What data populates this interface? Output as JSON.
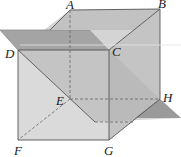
{
  "diagram": {
    "type": "geometry-figure",
    "colors": {
      "background": "#ffffff",
      "cube_face": "#d4d4d4",
      "horizontal_plane": "#a9a9a9",
      "diagonal_plane": "#b8b8b8",
      "edge": "#555555",
      "hidden_edge": "#666666"
    },
    "vertices": {
      "A": {
        "label": "A",
        "x": 70,
        "y": 10
      },
      "B": {
        "label": "B",
        "x": 160,
        "y": 9
      },
      "C": {
        "label": "C",
        "x": 109,
        "y": 50
      },
      "D": {
        "label": "D",
        "x": 18,
        "y": 50
      },
      "E": {
        "label": "E",
        "x": 70,
        "y": 99
      },
      "F": {
        "label": "F",
        "x": 18,
        "y": 140
      },
      "G": {
        "label": "G",
        "x": 109,
        "y": 140
      },
      "H": {
        "label": "H",
        "x": 160,
        "y": 99
      }
    },
    "labels": {
      "A": "A",
      "B": "B",
      "C": "C",
      "D": "D",
      "E": "E",
      "F": "F",
      "G": "G",
      "H": "H"
    }
  }
}
